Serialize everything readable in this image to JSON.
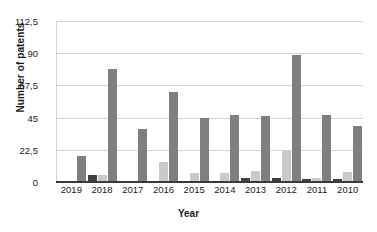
{
  "chart_data": {
    "type": "bar",
    "title": "",
    "xlabel": "Year",
    "ylabel": "Number of patents",
    "categories": [
      "2019",
      "2018",
      "2017",
      "2016",
      "2015",
      "2014",
      "2013",
      "2012",
      "2011",
      "2010"
    ],
    "ylim": [
      0,
      112.5
    ],
    "yticks": [
      "0",
      "22,5",
      "45",
      "67,5",
      "90",
      "112,5"
    ],
    "ytick_values": [
      0,
      22.5,
      45,
      67.5,
      90,
      112.5
    ],
    "grid": true,
    "legend": "none",
    "series": [
      {
        "name": "series-1-dark",
        "color": "#404040",
        "values": [
          1,
          5,
          1,
          0,
          0,
          0,
          3,
          3,
          2,
          2
        ]
      },
      {
        "name": "series-2-light",
        "color": "#c9c9c9",
        "values": [
          0,
          5,
          0,
          14,
          6,
          6,
          8,
          22,
          3,
          7
        ]
      },
      {
        "name": "series-3-medium",
        "color": "#7f7f7f",
        "values": [
          18,
          79,
          37,
          63,
          45,
          47,
          46,
          89,
          47,
          39
        ]
      }
    ]
  }
}
